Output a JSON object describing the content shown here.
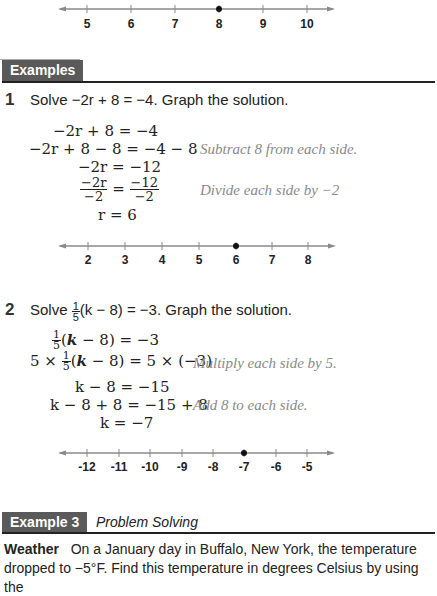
{
  "number_lines": [
    {
      "id": "top",
      "ticks": [
        "5",
        "6",
        "7",
        "8",
        "9",
        "10"
      ],
      "point": "8"
    },
    {
      "id": "example1",
      "ticks": [
        "2",
        "3",
        "4",
        "5",
        "6",
        "7",
        "8"
      ],
      "point": "6"
    },
    {
      "id": "example2",
      "ticks": [
        "-12",
        "-11",
        "-10",
        "-9",
        "-8",
        "-7",
        "-6",
        "-5"
      ],
      "point": "-7"
    }
  ],
  "section_header": {
    "label": "Examples"
  },
  "example1": {
    "number": "1",
    "prompt_pre": "Solve ",
    "prompt_eq": "−2r + 8 = −4",
    "prompt_post": ". Graph the solution.",
    "steps": [
      {
        "math": "−2r + 8 = −4",
        "note": ""
      },
      {
        "math": "−2r + 8 − 8 = −4 − 8",
        "note": "Subtract 8 from each side."
      },
      {
        "math": "−2r = −12",
        "note": ""
      },
      {
        "math": "−2r/−2 = −12/−2",
        "note": "Divide each side by −2"
      },
      {
        "math": "r = 6",
        "note": ""
      }
    ],
    "frac_left_num": "−2r",
    "frac_left_den": "−2",
    "frac_right_num": "−12",
    "frac_right_den": "−2"
  },
  "example2": {
    "number": "2",
    "prompt_pre": "Solve ",
    "prompt_frac_num": "1",
    "prompt_frac_den": "5",
    "prompt_eq": "(k − 8) = −3",
    "prompt_post": ". Graph the solution.",
    "steps": [
      {
        "math": "1/5 (k − 8) = −3",
        "note": ""
      },
      {
        "math": "5 × 1/5 (k − 8) = 5 × (−3)",
        "note": "Multiply each side by 5."
      },
      {
        "math": "k − 8 = −15",
        "note": ""
      },
      {
        "math": "k − 8 + 8 = −15 + 8",
        "note": "Add 8 to each side."
      },
      {
        "math": "k = −7",
        "note": ""
      }
    ]
  },
  "example3": {
    "label": "Example 3",
    "subtitle": "Problem Solving",
    "topic": "Weather",
    "text": "On a January day in Buffalo, New York, the temperature dropped to −5°F. Find this temperature in degrees Celsius by using the"
  }
}
